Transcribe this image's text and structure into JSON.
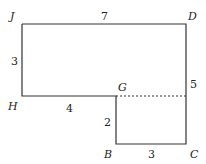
{
  "figure": {
    "type": "composite-rectilinear-shape",
    "vertices": [
      {
        "id": "J",
        "label": "J"
      },
      {
        "id": "D",
        "label": "D"
      },
      {
        "id": "C",
        "label": "C"
      },
      {
        "id": "B",
        "label": "B"
      },
      {
        "id": "G",
        "label": "G"
      },
      {
        "id": "H",
        "label": "H"
      }
    ],
    "side_lengths": {
      "JD": "7",
      "JH": "3",
      "HG": "4",
      "GB": "2",
      "BC": "3",
      "DC_upper": "5"
    },
    "dashed_segment": "G to DC",
    "colors": {
      "line": "#333333",
      "text": "#222222",
      "background": "#ffffff"
    }
  }
}
